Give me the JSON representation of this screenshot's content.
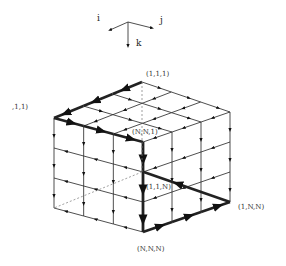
{
  "axes": {
    "i": "i",
    "j": "j",
    "k": "k"
  },
  "labels": {
    "back_top": "(1,1,1)",
    "left_top": ",1,1)",
    "front_top": "(N,N,1)",
    "center": "(1,1,N)",
    "right_bottom": "(1,N,N)",
    "front_bottom": "(N,N,N)"
  },
  "grid": {
    "divisions": 3
  },
  "colors": {
    "line": "#111111",
    "thin": "#333333",
    "dashed": "#666666"
  }
}
